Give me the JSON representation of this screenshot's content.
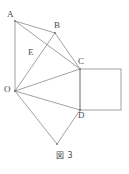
{
  "figure": {
    "caption": "図 3",
    "caption_label": "図",
    "caption_number": "3",
    "line_color": "#8a8a8a",
    "label_color": "#4a4a4a",
    "background_color": "#ffffff",
    "width": 129,
    "height": 174
  },
  "vertices": [
    {
      "id": "A",
      "label": "A",
      "x": 15,
      "y": 21,
      "label_x": 7,
      "label_y": 10,
      "dot": true
    },
    {
      "id": "B",
      "label": "B",
      "x": 55,
      "y": 33,
      "label_x": 54,
      "label_y": 21,
      "dot": true
    },
    {
      "id": "E",
      "label": "E",
      "x": 38,
      "y": 55,
      "label_x": 28,
      "label_y": 48,
      "dot": false
    },
    {
      "id": "C",
      "label": "C",
      "x": 80,
      "y": 69,
      "label_x": 78,
      "label_y": 57,
      "dot": true
    },
    {
      "id": "O",
      "label": "O",
      "x": 15,
      "y": 91,
      "label_x": 4,
      "label_y": 85,
      "dot": true
    },
    {
      "id": "D",
      "label": "D",
      "x": 80,
      "y": 110,
      "label_x": 78,
      "label_y": 111,
      "dot": true
    },
    {
      "id": "F",
      "label": "",
      "x": 57,
      "y": 144,
      "label_x": 0,
      "label_y": 0,
      "dot": true
    }
  ],
  "edges": [
    {
      "name": "edge-A-B",
      "from": "A",
      "to": "B",
      "x1": 15,
      "y1": 21,
      "x2": 55,
      "y2": 33
    },
    {
      "name": "edge-A-O",
      "from": "A",
      "to": "O",
      "x1": 15,
      "y1": 21,
      "x2": 15,
      "y2": 91
    },
    {
      "name": "edge-A-C",
      "from": "A",
      "to": "C",
      "x1": 15,
      "y1": 21,
      "x2": 80,
      "y2": 69
    },
    {
      "name": "edge-B-O",
      "from": "B",
      "to": "O",
      "x1": 55,
      "y1": 33,
      "x2": 15,
      "y2": 91
    },
    {
      "name": "edge-B-C",
      "from": "B",
      "to": "C",
      "x1": 55,
      "y1": 33,
      "x2": 80,
      "y2": 69
    },
    {
      "name": "edge-O-C",
      "from": "O",
      "to": "C",
      "x1": 15,
      "y1": 91,
      "x2": 80,
      "y2": 69
    },
    {
      "name": "edge-O-D",
      "from": "O",
      "to": "D",
      "x1": 15,
      "y1": 91,
      "x2": 80,
      "y2": 110
    },
    {
      "name": "edge-C-D",
      "from": "C",
      "to": "D",
      "x1": 80,
      "y1": 69,
      "x2": 80,
      "y2": 110
    },
    {
      "name": "edge-O-F",
      "from": "O",
      "to": "F",
      "x1": 15,
      "y1": 91,
      "x2": 57,
      "y2": 144
    },
    {
      "name": "edge-D-F",
      "from": "D",
      "to": "F",
      "x1": 80,
      "y1": 110,
      "x2": 57,
      "y2": 144
    }
  ],
  "square": {
    "name": "square-CD",
    "x": 80,
    "y": 69,
    "width": 41,
    "height": 41,
    "top_left": "C",
    "bottom_left": "D"
  }
}
